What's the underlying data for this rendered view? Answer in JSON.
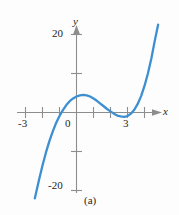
{
  "figure": {
    "caption": "(a)",
    "background_color": "#fdfdfd"
  },
  "axes": {
    "x_axis_name": "x",
    "y_axis_name": "y",
    "axis_color": "#8d8d8d",
    "text_color": "#1d1d1d"
  },
  "chart_data": {
    "type": "line",
    "title": "",
    "subtitle": "",
    "xlabel": "x",
    "ylabel": "y",
    "xlim": [
      -3.6,
      5.0
    ],
    "ylim": [
      -23,
      23
    ],
    "grid": false,
    "legend": null,
    "curve_color": "#3d8fd1",
    "annotations": [
      "(a)"
    ],
    "x_ticks": [
      -3,
      -2,
      -1,
      0,
      1,
      2,
      3,
      4
    ],
    "x_tick_labels": [
      "-3",
      "",
      "",
      "0",
      "",
      "",
      "3",
      ""
    ],
    "y_ticks": [
      20,
      10,
      0,
      -10,
      -20
    ],
    "y_tick_labels": [
      "20",
      "",
      "",
      "",
      "-20"
    ],
    "series": [
      {
        "name": "cubic curve",
        "x": [
          -2.45,
          -2.2,
          -2.0,
          -1.8,
          -1.6,
          -1.4,
          -1.2,
          -1.0,
          -0.8,
          -0.6,
          -0.4,
          -0.2,
          0.0,
          0.2,
          0.4,
          0.6,
          0.8,
          1.0,
          1.2,
          1.4,
          1.6,
          1.8,
          2.0,
          2.2,
          2.4,
          2.6,
          2.8,
          3.0,
          3.2,
          3.4,
          3.6,
          3.8,
          4.0,
          4.2,
          4.4,
          4.6,
          4.8
        ],
        "y": [
          -22.0,
          -17.2,
          -13.6,
          -10.3,
          -7.4,
          -4.9,
          -2.7,
          -0.9,
          0.6,
          1.9,
          2.9,
          3.6,
          4.1,
          4.4,
          4.5,
          4.4,
          4.1,
          3.6,
          3.0,
          2.3,
          1.6,
          0.9,
          0.3,
          -0.3,
          -0.8,
          -1.0,
          -1.1,
          -0.9,
          -0.3,
          0.7,
          2.2,
          4.2,
          6.8,
          10.0,
          13.8,
          18.3,
          22.5
        ]
      }
    ],
    "features": {
      "local_maximum": {
        "x": 0.4,
        "y": 4.5
      },
      "local_minimum": {
        "x": 2.8,
        "y": -1.1
      },
      "x_intercepts": [
        -0.9,
        2.1,
        3.3
      ]
    }
  },
  "labels": {
    "x_neg3": "-3",
    "x_0": "0",
    "x_3": "3",
    "y_20": "20",
    "y_neg20": "-20"
  }
}
